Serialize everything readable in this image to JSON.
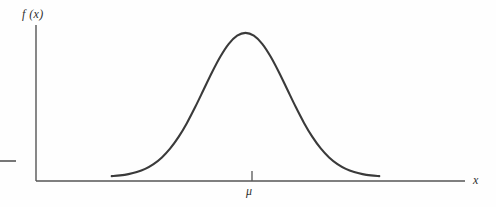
{
  "figure": {
    "background_color": "#fefefe",
    "line_color": "#3a3a3a",
    "axis_color": "#555555"
  },
  "labels": {
    "y_axis": "f (x)",
    "x_axis": "x",
    "mean_tick": "μ"
  },
  "chart_data": {
    "type": "line",
    "title": "",
    "subtitle": "",
    "xlabel": "x",
    "ylabel": "f (x)",
    "grid": false,
    "legend": null,
    "annotations": [
      {
        "text": "μ",
        "x": 0,
        "y": 0,
        "position": "below-x-axis",
        "note": "tick mark on x-axis at the mean, located under the curve peak"
      }
    ],
    "xlim": [
      -3.6,
      3.6
    ],
    "ylim": [
      0,
      0.44
    ],
    "xticks": [
      0
    ],
    "xticklabels": [
      "μ"
    ],
    "yticks": [],
    "yticklabels": [],
    "series": [
      {
        "name": "normal density",
        "x": [
          -3.2,
          -3.0,
          -2.8,
          -2.6,
          -2.4,
          -2.2,
          -2.0,
          -1.8,
          -1.6,
          -1.4,
          -1.2,
          -1.0,
          -0.8,
          -0.6,
          -0.4,
          -0.2,
          0.0,
          0.2,
          0.4,
          0.6,
          0.8,
          1.0,
          1.2,
          1.4,
          1.6,
          1.8,
          2.0,
          2.2,
          2.4,
          2.6,
          2.8,
          3.0,
          3.2
        ],
        "y": [
          0.0024,
          0.0044,
          0.0079,
          0.0136,
          0.0224,
          0.0355,
          0.054,
          0.079,
          0.1109,
          0.1497,
          0.1942,
          0.242,
          0.2897,
          0.3332,
          0.3683,
          0.391,
          0.3989,
          0.391,
          0.3683,
          0.3332,
          0.2897,
          0.242,
          0.1942,
          0.1497,
          0.1109,
          0.079,
          0.054,
          0.0355,
          0.0224,
          0.0136,
          0.0079,
          0.0044,
          0.0024
        ]
      }
    ]
  }
}
